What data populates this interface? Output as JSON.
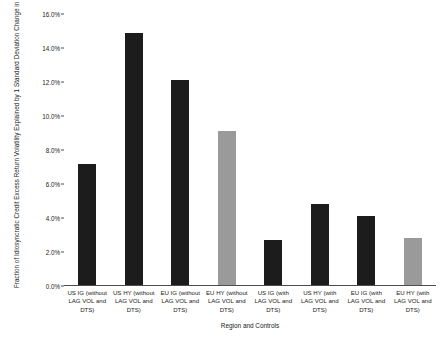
{
  "chart_data": {
    "type": "bar",
    "title": "",
    "xlabel": "Region and Controls",
    "ylabel": "Fraction of Idiosyncratic Credit Excess Return Volatility Explained by 1 Standard Deviation Change in Sustainability Score",
    "categories": [
      "US IG (without LAG VOL and DTS)",
      "US HY (without LAG VOL and DTS)",
      "EU IG (without LAG VOL and DTS)",
      "EU HY (without LAG VOL and DTS)",
      "US IG (with LAG VOL and DTS)",
      "US HY (with LAG VOL and DTS)",
      "EU IG (with LAG VOL and DTS)",
      "EU HY (with LAG VOL and DTS)"
    ],
    "values": [
      7.2,
      14.9,
      12.1,
      9.1,
      2.7,
      4.8,
      4.1,
      2.8
    ],
    "value_unit": "percent",
    "bar_colors": [
      "#1c1c1c",
      "#1c1c1c",
      "#1c1c1c",
      "#9a9a9a",
      "#1c1c1c",
      "#1c1c1c",
      "#1c1c1c",
      "#9a9a9a"
    ],
    "ylim": [
      0,
      16
    ],
    "ytick_values": [
      0,
      2,
      4,
      6,
      8,
      10,
      12,
      14,
      16
    ],
    "ytick_labels": [
      "0.0%",
      "2.0%",
      "4.0%",
      "6.0%",
      "8.0%",
      "10.0%",
      "12.0%",
      "14.0%",
      "16.0%"
    ],
    "grid": false,
    "legend": "none",
    "background": "#ffffff"
  }
}
